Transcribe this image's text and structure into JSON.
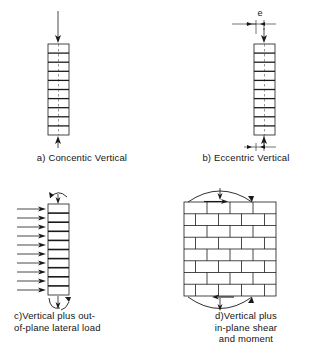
{
  "figure": {
    "background_color": "#ffffff",
    "line_color": "#1a1a1a",
    "panel_count": 4
  },
  "panels": [
    {
      "id": "a",
      "caption": "a) Concentic  Vertical",
      "element": "masonry column",
      "courses": 10,
      "loads": [
        "axial-load-arrow-top",
        "axial-load-arrow-bottom"
      ],
      "eccentricity_label": null
    },
    {
      "id": "b",
      "caption": "b) Eccentric  Vertical",
      "element": "masonry column",
      "courses": 10,
      "loads": [
        "axial-load-arrow-top",
        "axial-load-arrow-bottom"
      ],
      "eccentricity_label": "e"
    },
    {
      "id": "c",
      "caption": "c)Vertical plus  out-\n   of-plane lateral load",
      "element": "masonry column",
      "courses": 10,
      "lateral_arrow_count": 10,
      "loads": [
        "lateral-load-arrows",
        "axial-load-arrow-top",
        "axial-load-arrow-bottom",
        "moment-arrow-top",
        "moment-arrow-bottom"
      ],
      "eccentricity_label": null
    },
    {
      "id": "d",
      "caption": "d)Vertical plus\n   in-plane shear\n   and moment",
      "element": "masonry wall",
      "courses": 8,
      "loads": [
        "axial-load-arrow-top",
        "axial-load-arrow-bottom",
        "moment-arrow-top",
        "moment-arrow-bottom",
        "shear-arrow-top",
        "shear-arrow-bottom"
      ],
      "eccentricity_label": null
    }
  ],
  "symbols": {
    "eccentricity": "e"
  }
}
